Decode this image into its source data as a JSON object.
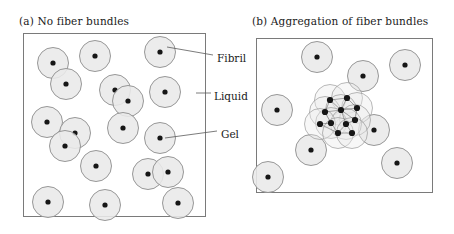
{
  "figure": {
    "width": 454,
    "height": 234,
    "background": "#ffffff",
    "style": {
      "circle_fill": "#e9e9e9",
      "circle_stroke": "#8c8c8c",
      "dot_fill": "#161616",
      "panel_stroke": "#7a7a7a",
      "leader_stroke": "#5a5a5a",
      "text_color": "#1a1a1a"
    }
  },
  "panels": {
    "a": {
      "label": "(a)",
      "title": "(a)  No fiber bundles",
      "frame": {
        "x": 23,
        "y": 33,
        "width": 182,
        "height": 183
      }
    },
    "b": {
      "label": "(b)",
      "title": "(b)  Aggregation of fiber bundles",
      "frame": {
        "x": 256,
        "y": 38,
        "width": 176,
        "height": 154
      }
    }
  },
  "callouts": [
    {
      "name": "fibril",
      "label": "Fibril",
      "text_x": 217,
      "text_y": 52,
      "line": {
        "x1": 213,
        "y1": 55,
        "x2": 167,
        "y2": 47
      }
    },
    {
      "name": "liquid",
      "label": "Liquid",
      "text_x": 214,
      "text_y": 90,
      "line": {
        "x1": 211,
        "y1": 93,
        "x2": 196,
        "y2": 93
      }
    },
    {
      "name": "gel",
      "label": "Gel",
      "text_x": 221,
      "text_y": 128,
      "line": {
        "x1": 217,
        "y1": 131,
        "x2": 165,
        "y2": 138
      }
    }
  ],
  "circle_radius": 15.5,
  "dot_radius": 2.6,
  "panel_a_particles": [
    {
      "cx": 53,
      "cy": 63
    },
    {
      "cx": 95,
      "cy": 56
    },
    {
      "cx": 160,
      "cy": 52
    },
    {
      "cx": 66,
      "cy": 84
    },
    {
      "cx": 115,
      "cy": 90
    },
    {
      "cx": 128,
      "cy": 101
    },
    {
      "cx": 165,
      "cy": 92
    },
    {
      "cx": 47,
      "cy": 122
    },
    {
      "cx": 75,
      "cy": 133
    },
    {
      "cx": 65,
      "cy": 146
    },
    {
      "cx": 123,
      "cy": 128
    },
    {
      "cx": 160,
      "cy": 138
    },
    {
      "cx": 96,
      "cy": 166
    },
    {
      "cx": 148,
      "cy": 174
    },
    {
      "cx": 168,
      "cy": 172
    },
    {
      "cx": 48,
      "cy": 202
    },
    {
      "cx": 105,
      "cy": 205
    },
    {
      "cx": 178,
      "cy": 203
    }
  ],
  "panel_b_particles": [
    {
      "cx": 317,
      "cy": 57
    },
    {
      "cx": 363,
      "cy": 76
    },
    {
      "cx": 405,
      "cy": 65
    },
    {
      "cx": 277,
      "cy": 110
    },
    {
      "cx": 374,
      "cy": 130
    },
    {
      "cx": 311,
      "cy": 150
    },
    {
      "cx": 268,
      "cy": 177
    },
    {
      "cx": 397,
      "cy": 163
    }
  ],
  "panel_b_cluster": {
    "center_x": 341,
    "center_y": 113,
    "circle_radius": 15.5,
    "members": [
      {
        "cx": 330,
        "cy": 100
      },
      {
        "cx": 347,
        "cy": 98
      },
      {
        "cx": 357,
        "cy": 108
      },
      {
        "cx": 325,
        "cy": 112
      },
      {
        "cx": 341,
        "cy": 110
      },
      {
        "cx": 355,
        "cy": 120
      },
      {
        "cx": 331,
        "cy": 123
      },
      {
        "cx": 346,
        "cy": 124
      },
      {
        "cx": 320,
        "cy": 124
      },
      {
        "cx": 338,
        "cy": 133
      },
      {
        "cx": 352,
        "cy": 133
      }
    ],
    "links": [
      [
        0,
        1
      ],
      [
        1,
        2
      ],
      [
        0,
        3
      ],
      [
        1,
        4
      ],
      [
        2,
        5
      ],
      [
        3,
        4
      ],
      [
        4,
        5
      ],
      [
        3,
        6
      ],
      [
        4,
        7
      ],
      [
        6,
        8
      ],
      [
        6,
        9
      ],
      [
        7,
        9
      ],
      [
        7,
        10
      ],
      [
        9,
        10
      ],
      [
        0,
        4
      ],
      [
        5,
        7
      ],
      [
        8,
        9
      ],
      [
        2,
        4
      ]
    ]
  }
}
